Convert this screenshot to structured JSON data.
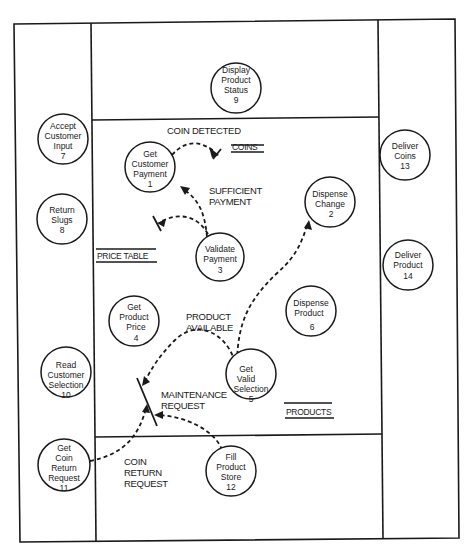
{
  "diagram": {
    "type": "data-flow-diagram",
    "panels": [
      "left",
      "top-center",
      "center",
      "bottom-center",
      "right"
    ],
    "processes": [
      {
        "id": "1",
        "lines": [
          "Get",
          "Customer",
          "Payment",
          "1"
        ]
      },
      {
        "id": "2",
        "lines": [
          "Dispense",
          "Change",
          "2"
        ]
      },
      {
        "id": "3",
        "lines": [
          "Validate",
          "Payment",
          "3"
        ]
      },
      {
        "id": "4",
        "lines": [
          "Get",
          "Product",
          "Price",
          "4"
        ]
      },
      {
        "id": "5",
        "lines": [
          "Get",
          "Valid",
          "Selection",
          "5"
        ]
      },
      {
        "id": "6",
        "lines": [
          "Dispense",
          "Product",
          "6"
        ]
      },
      {
        "id": "7",
        "lines": [
          "Accept",
          "Customer",
          "Input",
          "7"
        ]
      },
      {
        "id": "8",
        "lines": [
          "Return",
          "Slugs",
          "8"
        ]
      },
      {
        "id": "9",
        "lines": [
          "Display",
          "Product",
          "Status",
          "9"
        ]
      },
      {
        "id": "10",
        "lines": [
          "Read",
          "Customer",
          "Selection",
          "10"
        ]
      },
      {
        "id": "11",
        "lines": [
          "Get",
          "Coin",
          "Return",
          "Request",
          "11"
        ]
      },
      {
        "id": "12",
        "lines": [
          "Fill",
          "Product",
          "Store",
          "12"
        ]
      },
      {
        "id": "13",
        "lines": [
          "Deliver",
          "Coins",
          "13"
        ]
      },
      {
        "id": "14",
        "lines": [
          "Deliver",
          "Product",
          "14"
        ]
      }
    ],
    "stores": {
      "coins": "COINS",
      "price_table": "PRICE TABLE",
      "products": "PRODUCTS"
    },
    "flows": {
      "coin_detected": "COIN DETECTED",
      "sufficient_payment": [
        "SUFFICIENT",
        "PAYMENT"
      ],
      "product_available": [
        "PRODUCT",
        "AVAILABLE"
      ],
      "maintenance_request": [
        "MAINTENANCE",
        "REQUEST"
      ],
      "coin_return_request": [
        "COIN",
        "RETURN",
        "REQUEST"
      ]
    }
  }
}
